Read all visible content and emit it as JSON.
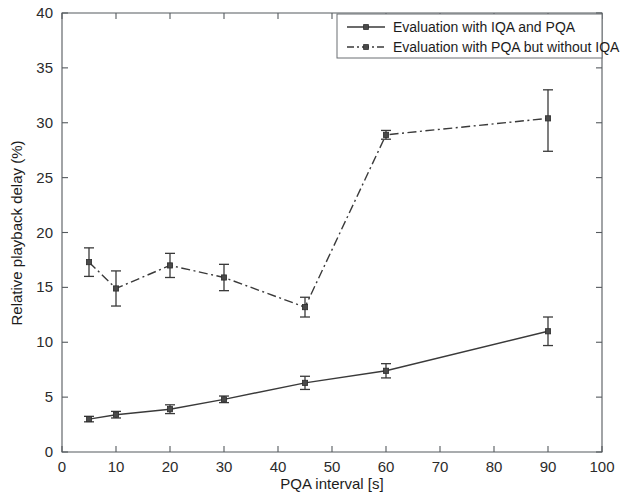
{
  "chart_data": {
    "type": "line",
    "title": "",
    "xlabel": "PQA interval [s]",
    "ylabel": "Relative playback delay (%)",
    "xlim": [
      0,
      100
    ],
    "ylim": [
      0,
      40
    ],
    "xticks": [
      0,
      10,
      20,
      30,
      40,
      50,
      60,
      70,
      80,
      90,
      100
    ],
    "yticks": [
      0,
      5,
      10,
      15,
      20,
      25,
      30,
      35,
      40
    ],
    "grid": false,
    "legend_position": "top-right",
    "x": [
      5,
      10,
      20,
      30,
      45,
      60,
      90
    ],
    "series": [
      {
        "name": "Evaluation with IQA and PQA",
        "style": "solid",
        "marker": "square",
        "values": [
          3.0,
          3.4,
          3.9,
          4.8,
          6.3,
          7.4,
          11.0
        ],
        "error_lower": [
          0.25,
          0.3,
          0.4,
          0.3,
          0.6,
          0.65,
          1.3
        ],
        "error_upper": [
          0.25,
          0.3,
          0.4,
          0.3,
          0.6,
          0.65,
          1.3
        ]
      },
      {
        "name": "Evaluation with PQA but without IQA",
        "style": "dash-dot",
        "marker": "square",
        "values": [
          17.3,
          14.9,
          17.0,
          15.9,
          13.2,
          28.9,
          30.4
        ],
        "error_lower": [
          1.3,
          1.6,
          1.1,
          1.2,
          0.9,
          0.4,
          3.0
        ],
        "error_upper": [
          1.3,
          1.6,
          1.1,
          1.2,
          0.9,
          0.4,
          2.6
        ]
      }
    ]
  },
  "legend": {
    "entries": [
      {
        "label": "Evaluation with IQA and PQA",
        "style": "solid"
      },
      {
        "label": "Evaluation with PQA but without IQA",
        "style": "dash-dot"
      }
    ]
  },
  "axes": {
    "x_tick_labels": [
      "0",
      "10",
      "20",
      "30",
      "40",
      "50",
      "60",
      "70",
      "80",
      "90",
      "100"
    ],
    "y_tick_labels": [
      "0",
      "5",
      "10",
      "15",
      "20",
      "25",
      "30",
      "35",
      "40"
    ],
    "x_title": "PQA interval [s]",
    "y_title": "Relative playback delay (%)"
  },
  "colors": {
    "line": "#3a3a3a",
    "axis": "#555a5e",
    "text": "#1c1c1c",
    "background": "#ffffff"
  }
}
